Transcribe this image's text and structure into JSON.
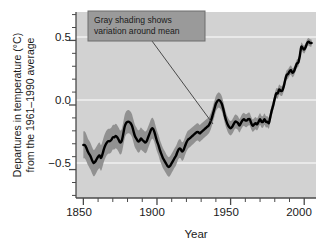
{
  "chart_data": {
    "type": "line",
    "title": "",
    "xlabel": "Year",
    "ylabel": "Departures in temperature (°C) from the 1961–1990 average",
    "ylabel_line1": "Departures in temperature (°C)",
    "ylabel_line2": "from the 1961–1990 average",
    "xlim": [
      1845,
      2008
    ],
    "ylim": [
      -0.72,
      0.72
    ],
    "xticks": [
      1850,
      1900,
      1950,
      2000
    ],
    "xtick_labels": [
      "1850",
      "1900",
      "1950",
      "2000"
    ],
    "xminor_step": 10,
    "yticks": [
      -0.5,
      0.0,
      0.5
    ],
    "ytick_labels": [
      "−0.5",
      "0.0",
      "0.5"
    ],
    "yminor_step": 0.1,
    "grid": "horizontal-white-gridlines-at-major-yticks",
    "legend": "none",
    "plot_background": "#d2d2d2",
    "band_color": "#8d8d8d",
    "line_color": "#000000",
    "axis_color": "#4a4a4a",
    "gridline_color": "#f0f0f0",
    "annotations": [
      {
        "name": "gray-shading-callout",
        "line1": "Gray shading shows",
        "line2": "variation around mean",
        "box_fill": "#9a9a9a",
        "box_border": "#6d6d6d",
        "leader_from": [
          1930,
          0.62
        ],
        "leader_to": [
          1932,
          -0.16
        ]
      }
    ],
    "series": [
      {
        "name": "Global mean temperature anomaly",
        "x": [
          1850,
          1851,
          1852,
          1853,
          1854,
          1855,
          1856,
          1857,
          1858,
          1859,
          1860,
          1861,
          1862,
          1863,
          1864,
          1865,
          1866,
          1867,
          1868,
          1869,
          1870,
          1871,
          1872,
          1873,
          1874,
          1875,
          1876,
          1877,
          1878,
          1879,
          1880,
          1881,
          1882,
          1883,
          1884,
          1885,
          1886,
          1887,
          1888,
          1889,
          1890,
          1891,
          1892,
          1893,
          1894,
          1895,
          1896,
          1897,
          1898,
          1899,
          1900,
          1901,
          1902,
          1903,
          1904,
          1905,
          1906,
          1907,
          1908,
          1909,
          1910,
          1911,
          1912,
          1913,
          1914,
          1915,
          1916,
          1917,
          1918,
          1919,
          1920,
          1921,
          1922,
          1923,
          1924,
          1925,
          1926,
          1927,
          1928,
          1929,
          1930,
          1931,
          1932,
          1933,
          1934,
          1935,
          1936,
          1937,
          1938,
          1939,
          1940,
          1941,
          1942,
          1943,
          1944,
          1945,
          1946,
          1947,
          1948,
          1949,
          1950,
          1951,
          1952,
          1953,
          1954,
          1955,
          1956,
          1957,
          1958,
          1959,
          1960,
          1961,
          1962,
          1963,
          1964,
          1965,
          1966,
          1967,
          1968,
          1969,
          1970,
          1971,
          1972,
          1973,
          1974,
          1975,
          1976,
          1977,
          1978,
          1979,
          1980,
          1981,
          1982,
          1983,
          1984,
          1985,
          1986,
          1987,
          1988,
          1989,
          1990,
          1991,
          1992,
          1993,
          1994,
          1995,
          1996,
          1997,
          1998,
          1999,
          2000,
          2001,
          2002,
          2003,
          2004,
          2005
        ],
        "values": [
          -0.31,
          -0.31,
          -0.33,
          -0.36,
          -0.38,
          -0.4,
          -0.43,
          -0.45,
          -0.44,
          -0.42,
          -0.4,
          -0.39,
          -0.41,
          -0.38,
          -0.34,
          -0.31,
          -0.29,
          -0.28,
          -0.28,
          -0.27,
          -0.25,
          -0.25,
          -0.24,
          -0.25,
          -0.27,
          -0.29,
          -0.28,
          -0.23,
          -0.17,
          -0.14,
          -0.13,
          -0.13,
          -0.14,
          -0.16,
          -0.2,
          -0.24,
          -0.26,
          -0.28,
          -0.28,
          -0.26,
          -0.27,
          -0.28,
          -0.29,
          -0.28,
          -0.25,
          -0.22,
          -0.19,
          -0.18,
          -0.2,
          -0.24,
          -0.28,
          -0.31,
          -0.35,
          -0.38,
          -0.41,
          -0.43,
          -0.45,
          -0.47,
          -0.48,
          -0.47,
          -0.45,
          -0.43,
          -0.41,
          -0.39,
          -0.36,
          -0.34,
          -0.34,
          -0.36,
          -0.35,
          -0.32,
          -0.29,
          -0.27,
          -0.26,
          -0.25,
          -0.24,
          -0.23,
          -0.22,
          -0.21,
          -0.21,
          -0.22,
          -0.21,
          -0.2,
          -0.19,
          -0.18,
          -0.17,
          -0.16,
          -0.14,
          -0.11,
          -0.07,
          -0.03,
          0.01,
          0.03,
          0.04,
          0.03,
          0.01,
          -0.03,
          -0.08,
          -0.12,
          -0.15,
          -0.17,
          -0.18,
          -0.17,
          -0.15,
          -0.13,
          -0.13,
          -0.14,
          -0.16,
          -0.14,
          -0.12,
          -0.11,
          -0.12,
          -0.12,
          -0.11,
          -0.11,
          -0.14,
          -0.16,
          -0.15,
          -0.14,
          -0.15,
          -0.13,
          -0.11,
          -0.13,
          -0.13,
          -0.11,
          -0.13,
          -0.13,
          -0.14,
          -0.09,
          -0.04,
          0.0,
          0.05,
          0.09,
          0.09,
          0.12,
          0.11,
          0.11,
          0.14,
          0.19,
          0.23,
          0.24,
          0.26,
          0.27,
          0.25,
          0.26,
          0.29,
          0.32,
          0.33,
          0.38,
          0.45,
          0.44,
          0.43,
          0.45,
          0.48,
          0.49,
          0.48,
          0.48
        ],
        "band_half_width_note": "uncertainty band widens early (±0.10 in 1850s) and narrows to ±0.03 by 2000"
      }
    ]
  },
  "axis": {
    "x_tick_label_1": "1850",
    "x_tick_label_2": "1900",
    "x_tick_label_3": "1950",
    "x_tick_label_4": "2000",
    "y_tick_label_1": "0.5",
    "y_tick_label_2": "0.0",
    "y_tick_label_3": "−0.5"
  }
}
